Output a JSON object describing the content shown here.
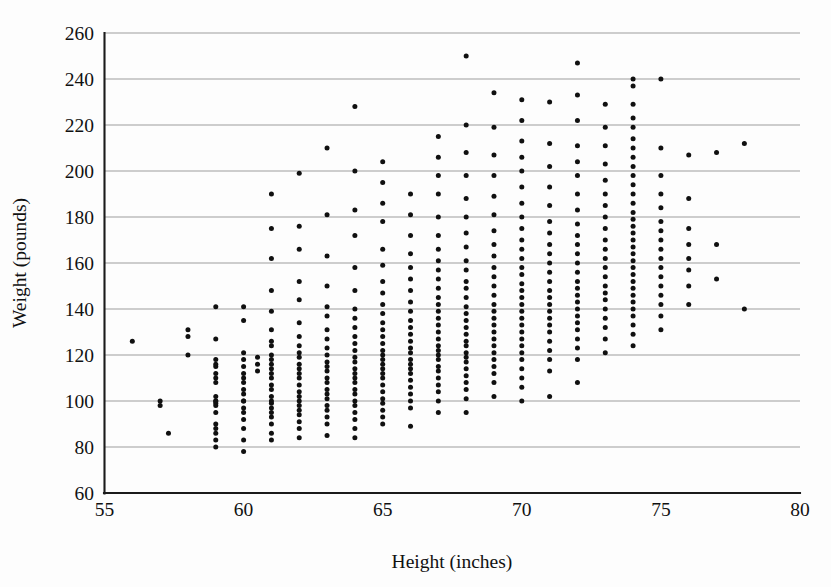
{
  "chart_data": {
    "type": "scatter",
    "title": "",
    "xlabel": "Height (inches)",
    "ylabel": "Weight (pounds)",
    "xlim": [
      55,
      80
    ],
    "ylim": [
      60,
      260
    ],
    "xticks": [
      55,
      60,
      65,
      70,
      75,
      80
    ],
    "yticks": [
      60,
      80,
      100,
      120,
      140,
      160,
      180,
      200,
      220,
      240,
      260
    ],
    "grid": "horizontal",
    "legend": "none",
    "marker": "filled-circle",
    "marker_color": "#101010",
    "marker_size_px": 5,
    "point_count": 507,
    "series": [
      {
        "name": "Height vs Weight",
        "x": [
          56,
          57,
          57,
          57.3,
          58,
          58,
          58,
          59,
          59,
          59,
          59,
          59,
          59,
          59,
          59,
          59,
          59,
          59,
          59,
          59,
          59,
          59,
          59,
          59,
          59,
          59,
          60,
          60,
          60,
          60,
          60,
          60,
          60,
          60,
          60,
          60,
          60,
          60,
          60,
          60,
          60,
          60,
          60,
          60,
          60.5,
          60.5,
          60.5,
          61,
          61,
          61,
          61,
          61,
          61,
          61,
          61,
          61,
          61,
          61,
          61,
          61,
          61,
          61,
          61,
          61,
          61,
          61,
          61,
          61,
          61,
          61,
          61,
          61,
          62,
          62,
          62,
          62,
          62,
          62,
          62,
          62,
          62,
          62,
          62,
          62,
          62,
          62,
          62,
          62,
          62,
          62,
          62,
          62,
          62,
          62,
          62,
          62,
          63,
          63,
          63,
          63,
          63,
          63,
          63,
          63,
          63,
          63,
          63,
          63,
          63,
          63,
          63,
          63,
          63,
          63,
          63,
          63,
          63,
          63,
          63,
          64,
          64,
          64,
          64,
          64,
          64,
          64,
          64,
          64,
          64,
          64,
          64,
          64,
          64,
          64,
          64,
          64,
          64,
          64,
          64,
          64,
          64,
          64,
          64,
          64,
          64,
          65,
          65,
          65,
          65,
          65,
          65,
          65,
          65,
          65,
          65,
          65,
          65,
          65,
          65,
          65,
          65,
          65,
          65,
          65,
          65,
          65,
          65,
          65,
          65,
          65,
          65,
          65,
          65,
          66,
          66,
          66,
          66,
          66,
          66,
          66,
          66,
          66,
          66,
          66,
          66,
          66,
          66,
          66,
          66,
          66,
          66,
          66,
          66,
          66,
          66,
          66,
          66,
          66,
          67,
          67,
          67,
          67,
          67,
          67,
          67,
          67,
          67,
          67,
          67,
          67,
          67,
          67,
          67,
          67,
          67,
          67,
          67,
          67,
          67,
          67,
          67,
          67,
          67,
          67,
          67,
          67,
          67,
          68,
          68,
          68,
          68,
          68,
          68,
          68,
          68,
          68,
          68,
          68,
          68,
          68,
          68,
          68,
          68,
          68,
          68,
          68,
          68,
          68,
          68,
          68,
          68,
          68,
          68,
          68,
          68,
          68,
          69,
          69,
          69,
          69,
          69,
          69,
          69,
          69,
          69,
          69,
          69,
          69,
          69,
          69,
          69,
          69,
          69,
          69,
          69,
          69,
          69,
          69,
          69,
          69,
          69,
          69,
          70,
          70,
          70,
          70,
          70,
          70,
          70,
          70,
          70,
          70,
          70,
          70,
          70,
          70,
          70,
          70,
          70,
          70,
          70,
          70,
          70,
          70,
          70,
          70,
          70,
          70,
          70,
          70,
          70,
          70,
          71,
          71,
          71,
          71,
          71,
          71,
          71,
          71,
          71,
          71,
          71,
          71,
          71,
          71,
          71,
          71,
          71,
          71,
          71,
          71,
          71,
          71,
          71,
          71,
          72,
          72,
          72,
          72,
          72,
          72,
          72,
          72,
          72,
          72,
          72,
          72,
          72,
          72,
          72,
          72,
          72,
          72,
          72,
          72,
          72,
          72,
          72,
          72,
          72,
          72,
          73,
          73,
          73,
          73,
          73,
          73,
          73,
          73,
          73,
          73,
          73,
          73,
          73,
          73,
          73,
          73,
          73,
          73,
          73,
          73,
          73,
          73,
          74,
          74,
          74,
          74,
          74,
          74,
          74,
          74,
          74,
          74,
          74,
          74,
          74,
          74,
          74,
          74,
          74,
          74,
          74,
          74,
          74,
          74,
          74,
          74,
          74,
          74,
          74,
          74,
          74,
          74,
          74,
          74,
          75,
          75,
          75,
          75,
          75,
          75,
          75,
          75,
          75,
          75,
          75,
          75,
          75,
          75,
          75,
          75,
          75,
          76,
          76,
          76,
          76,
          76,
          76,
          76,
          76,
          77,
          77,
          77,
          78,
          78
        ],
        "y": [
          126,
          98,
          100,
          86,
          120,
          128,
          131,
          80,
          83,
          86,
          88,
          90,
          95,
          98,
          99,
          100,
          100,
          102,
          108,
          110,
          112,
          115,
          116,
          118,
          127,
          141,
          78,
          83,
          88,
          92,
          95,
          97,
          100,
          100,
          103,
          105,
          108,
          110,
          112,
          115,
          118,
          121,
          135,
          141,
          113,
          116,
          119,
          83,
          86,
          90,
          93,
          95,
          97,
          99,
          100,
          102,
          105,
          107,
          110,
          112,
          114,
          116,
          118,
          120,
          124,
          126,
          131,
          139,
          148,
          162,
          175,
          190,
          84,
          88,
          91,
          94,
          96,
          98,
          100,
          102,
          104,
          107,
          110,
          112,
          114,
          116,
          119,
          121,
          124,
          128,
          134,
          144,
          152,
          166,
          176,
          199,
          85,
          90,
          93,
          96,
          98,
          101,
          103,
          105,
          108,
          110,
          113,
          115,
          117,
          120,
          123,
          127,
          131,
          137,
          141,
          150,
          163,
          181,
          210,
          84,
          88,
          92,
          95,
          98,
          100,
          103,
          105,
          108,
          110,
          112,
          114,
          117,
          119,
          122,
          125,
          128,
          132,
          136,
          140,
          148,
          158,
          172,
          183,
          200,
          228,
          90,
          93,
          96,
          99,
          101,
          104,
          107,
          110,
          112,
          114,
          116,
          118,
          120,
          122,
          125,
          128,
          131,
          134,
          138,
          142,
          147,
          152,
          159,
          166,
          178,
          186,
          195,
          204,
          89,
          97,
          100,
          103,
          106,
          109,
          112,
          114,
          116,
          118,
          121,
          123,
          126,
          129,
          132,
          135,
          139,
          143,
          148,
          153,
          158,
          164,
          172,
          181,
          190,
          95,
          100,
          104,
          107,
          110,
          113,
          115,
          118,
          120,
          122,
          124,
          127,
          130,
          133,
          136,
          139,
          142,
          145,
          149,
          153,
          157,
          161,
          166,
          172,
          180,
          190,
          198,
          206,
          215,
          95,
          101,
          105,
          108,
          111,
          114,
          117,
          119,
          121,
          124,
          126,
          129,
          132,
          135,
          138,
          141,
          145,
          149,
          152,
          157,
          161,
          167,
          173,
          180,
          188,
          198,
          208,
          220,
          250,
          102,
          108,
          112,
          115,
          118,
          121,
          124,
          127,
          130,
          133,
          136,
          139,
          142,
          146,
          150,
          154,
          158,
          163,
          168,
          174,
          181,
          189,
          198,
          207,
          219,
          234,
          100,
          106,
          110,
          114,
          118,
          121,
          124,
          127,
          130,
          133,
          136,
          139,
          142,
          145,
          148,
          151,
          155,
          158,
          162,
          166,
          170,
          175,
          180,
          186,
          193,
          200,
          206,
          213,
          222,
          231,
          102,
          113,
          118,
          122,
          126,
          130,
          133,
          136,
          139,
          142,
          145,
          148,
          152,
          156,
          160,
          164,
          168,
          173,
          178,
          185,
          193,
          202,
          212,
          230,
          108,
          118,
          123,
          127,
          131,
          134,
          137,
          140,
          143,
          146,
          149,
          152,
          156,
          160,
          164,
          168,
          172,
          177,
          183,
          190,
          198,
          204,
          211,
          222,
          233,
          247,
          121,
          127,
          132,
          136,
          140,
          144,
          147,
          150,
          154,
          158,
          162,
          166,
          170,
          175,
          180,
          185,
          190,
          196,
          203,
          211,
          219,
          229,
          124,
          129,
          133,
          137,
          140,
          143,
          146,
          149,
          152,
          155,
          158,
          161,
          164,
          167,
          170,
          173,
          176,
          179,
          182,
          186,
          190,
          194,
          198,
          202,
          206,
          210,
          214,
          219,
          223,
          229,
          237,
          240,
          131,
          137,
          142,
          146,
          150,
          154,
          158,
          162,
          166,
          170,
          174,
          178,
          184,
          190,
          198,
          210,
          240,
          142,
          150,
          157,
          162,
          168,
          175,
          188,
          207,
          153,
          168,
          208,
          140,
          212
        ]
      }
    ]
  },
  "axis": {
    "x_tick_labels": [
      "55",
      "60",
      "65",
      "70",
      "75",
      "80"
    ],
    "y_tick_labels": [
      "60",
      "80",
      "100",
      "120",
      "140",
      "160",
      "180",
      "200",
      "220",
      "240",
      "260"
    ],
    "x_title": "Height (inches)",
    "y_title": "Weight (pounds)"
  },
  "colors": {
    "background": "#fdfdfd",
    "axis": "#1b1b1b",
    "grid": "#8d8d8d",
    "marker": "#101010"
  }
}
